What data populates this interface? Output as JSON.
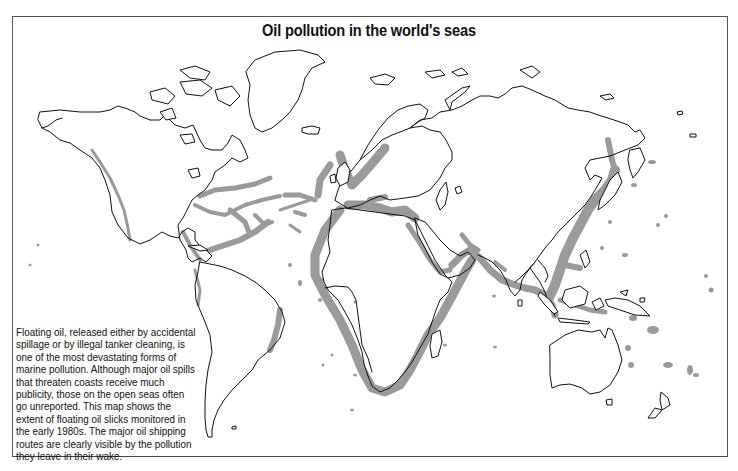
{
  "title": "Oil pollution in the world's seas",
  "caption": "Floating oil, released either by accidental spillage or by illegal tanker cleaning, is one of the most devastating forms of marine pollution. Although major oil spills that threaten coasts receive much publicity, those on the open seas often go unreported. This map shows the extent of floating oil slicks monitored in the early 1980s. The major oil shipping routes are clearly visible by the pollution they leave in their wake.",
  "legend": {
    "oil_slick_color": "#9a9a9a",
    "coastline_color": "#111111",
    "oil_slick_meaning": "floating oil slicks"
  },
  "map": {
    "projection": "world map, Pacific-clipped",
    "regions_with_heavy_pollution": [
      "North Atlantic / North Sea",
      "Mediterranean",
      "Cape of Good Hope route",
      "Red Sea / Persian Gulf",
      "Arabian Sea / Indian Ocean",
      "Strait of Malacca / South China Sea",
      "East China Sea / Japan",
      "Caribbean / Gulf of Mexico",
      "Brazil coast",
      "Pacific islands"
    ]
  }
}
